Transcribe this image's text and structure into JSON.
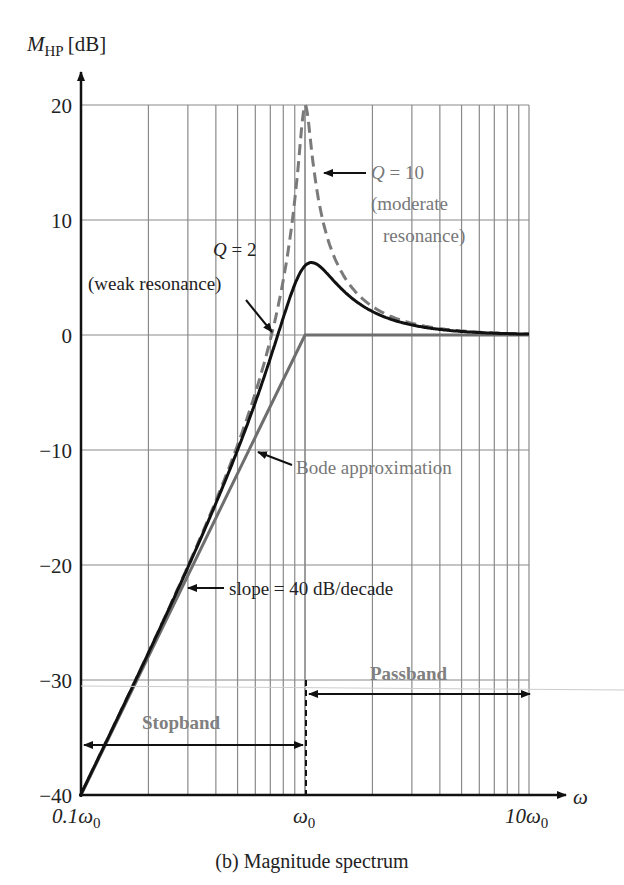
{
  "chart_data": {
    "type": "line",
    "title": "(b) Magnitude spectrum",
    "ylabel": "M_HP [dB]",
    "ylabel_main": "M",
    "ylabel_sub": "HP",
    "ylabel_unit": "[dB]",
    "xlabel": "ω",
    "x_scale": "log",
    "xlim_label": [
      "0.1ω0",
      "10ω0"
    ],
    "ylim": [
      -40,
      20
    ],
    "y_ticks": [
      20,
      10,
      0,
      -10,
      -20,
      -30,
      -40
    ],
    "y_tick_labels": [
      "20",
      "10",
      "0",
      "−10",
      "−20",
      "−30",
      "−40"
    ],
    "x_tick_labels": [
      {
        "main": "0.1ω",
        "sub": "0"
      },
      {
        "main": "ω",
        "sub": "0"
      },
      {
        "main": "10ω",
        "sub": "0"
      }
    ],
    "grid": true,
    "series": [
      {
        "name": "Bode approximation",
        "style": "solid gray",
        "x_over_w0": [
          0.1,
          1,
          10
        ],
        "values_db": [
          -40,
          0,
          0
        ]
      },
      {
        "name": "Q = 2 (weak resonance)",
        "style": "solid black",
        "x_over_w0": [
          0.1,
          0.2,
          0.3,
          0.5,
          0.7,
          0.85,
          1.0,
          1.1,
          1.3,
          1.6,
          2,
          3,
          5,
          10
        ],
        "values_db": [
          -40,
          -27.9,
          -20.6,
          -11.2,
          -4.2,
          1.5,
          6.0,
          5.6,
          3.9,
          2.2,
          1.2,
          0.5,
          0.2,
          0.0
        ]
      },
      {
        "name": "Q = 10 (moderate resonance)",
        "style": "dashed gray",
        "x_over_w0": [
          0.1,
          0.2,
          0.3,
          0.5,
          0.7,
          0.85,
          0.95,
          1.0,
          1.05,
          1.15,
          1.3,
          1.6,
          2,
          3,
          5,
          10
        ],
        "values_db": [
          -40,
          -27.9,
          -20.3,
          -9.6,
          -2.4,
          4.8,
          13.3,
          20.0,
          13.8,
          6.6,
          3.5,
          1.6,
          0.9,
          0.4,
          0.1,
          0.0
        ]
      }
    ],
    "annotations": [
      {
        "text_line1": "Q = 10",
        "text_line2": "(moderate",
        "text_line3": "resonance)"
      },
      {
        "text_line1": "Q = 2",
        "text_line2": "(weak resonance)"
      },
      {
        "text": "Bode approximation"
      },
      {
        "text": "slope = 40 dB/decade"
      },
      {
        "text": "Stopband"
      },
      {
        "text": "Passband"
      }
    ]
  }
}
